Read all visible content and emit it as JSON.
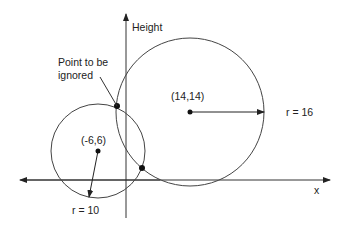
{
  "diagram": {
    "axes": {
      "vertical_label": "Height",
      "horizontal_label": "x"
    },
    "circles": [
      {
        "name": "large",
        "center_label": "(14,14)",
        "radius_label": "r = 16"
      },
      {
        "name": "small",
        "center_label": "(-6,6)",
        "radius_label": "r = 10"
      }
    ],
    "annotation": {
      "line1": "Point to be",
      "line2": "ignored"
    },
    "colors": {
      "stroke": "#333333",
      "background": "#ffffff"
    }
  }
}
